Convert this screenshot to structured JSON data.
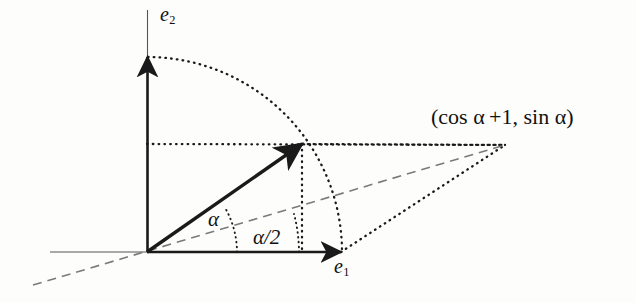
{
  "figure": {
    "background_color": "#fdfdfc",
    "ink_color": "#1a1a1a",
    "width": 636,
    "height": 303
  },
  "labels": {
    "axis_x": "e",
    "axis_x_sub": "1",
    "axis_y": "e",
    "axis_y_sub": "2",
    "angle_full": "α",
    "angle_half": "α/2",
    "point_label": "(cos α +1, sin α)"
  },
  "geometry": {
    "origin": {
      "x": 147,
      "y": 252
    },
    "x_axis": {
      "start_x": 50,
      "end_x": 341,
      "y": 252,
      "arrow_at_x": 341
    },
    "y_axis": {
      "x": 147,
      "top_y": 10,
      "bottom_y": 252,
      "arrow_at_y": 57
    },
    "vector": {
      "tip_x": 302,
      "tip_y": 144,
      "angle_degrees": 29
    },
    "arc_radius": 195,
    "arc_start": {
      "x": 148,
      "y": 57
    },
    "arc_end": {
      "x": 342,
      "y": 252
    },
    "sum_point": {
      "x": 505,
      "y": 145
    },
    "bisector": {
      "from_x": 33,
      "from_y": 285,
      "to_x": 505,
      "to_y": 145
    },
    "drop_line": {
      "x": 302,
      "from_y": 144,
      "to_y": 252
    },
    "horizontal_dotted": {
      "y": 144,
      "from_x": 147,
      "to_x": 505
    },
    "arc_alpha": {
      "radius": 90,
      "from_deg": 0,
      "to_deg": 29
    },
    "arc_half": {
      "radius": 152,
      "from_deg": 0,
      "to_deg": 14.5
    }
  }
}
